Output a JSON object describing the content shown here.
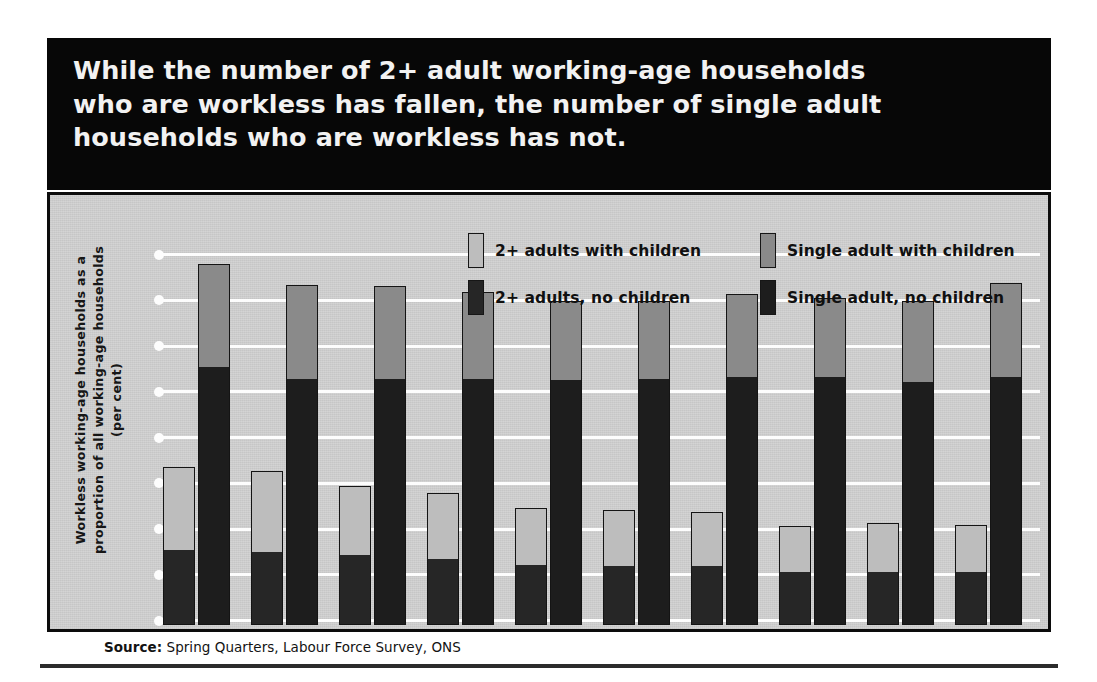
{
  "banner": {
    "title": "While the number of 2+ adult working-age households\nwho are workless has fallen, the number of single adult\nhouseholds who are workless has not."
  },
  "axis": {
    "y_title_line1": "Workless working-age households as a",
    "y_title_line2": "proportion of all working-age households",
    "y_title_line3": "(per cent)"
  },
  "legend": {
    "items": [
      {
        "label": "2+ adults with children",
        "swatch": "pair-light",
        "color": "#bdbdbd"
      },
      {
        "label": "2+ adults, no children",
        "swatch": "pair-dark",
        "color": "#262626"
      },
      {
        "label": "Single adult with children",
        "swatch": "single-light",
        "color": "#8a8a8a"
      },
      {
        "label": "Single adult, no children",
        "swatch": "single-dark",
        "color": "#1d1d1d"
      }
    ]
  },
  "source": {
    "prefix": "Source:",
    "text": " Spring Quarters, Labour Force Survey, ONS"
  },
  "chart_data": {
    "type": "bar",
    "subtype": "grouped-stacked",
    "title": "While the number of 2+ adult working-age households who are workless has fallen, the number of single adult households who are workless has not.",
    "xlabel": "",
    "ylabel": "Workless working-age households as a proportion of all working-age households (per cent)",
    "ylim": [
      0,
      9
    ],
    "yticks": [
      0,
      1,
      2,
      3,
      4,
      5,
      6,
      7,
      8,
      9
    ],
    "grid": true,
    "grid_axis": "y",
    "legend_position": "top-inside",
    "categories": [
      "1996",
      "1997",
      "1998",
      "1999",
      "2000",
      "2001",
      "2002",
      "2003",
      "2004",
      "2005"
    ],
    "groups": [
      {
        "name": "2+ adults",
        "series": [
          {
            "name": "2+ adults, no children",
            "color": "#262626",
            "values": [
              4.1,
              4.0,
              3.8,
              3.6,
              3.3,
              3.2,
              3.2,
              2.9,
              2.9,
              2.9
            ]
          },
          {
            "name": "2+ adults with children",
            "color": "#bdbdbd",
            "values": [
              4.4,
              4.3,
              3.7,
              3.5,
              3.0,
              3.0,
              2.9,
              2.4,
              2.6,
              2.5
            ]
          }
        ],
        "totals": [
          8.5,
          8.3,
          7.5,
          7.1,
          6.3,
          6.2,
          6.1,
          5.3,
          5.5,
          5.4
        ]
      },
      {
        "name": "Single adult",
        "series": [
          {
            "name": "Single adult, no children",
            "color": "#1d1d1d",
            "values": [
              13.9,
              13.3,
              13.3,
              13.3,
              13.2,
              13.3,
              13.4,
              13.4,
              13.1,
              13.4
            ]
          },
          {
            "name": "Single adult with children",
            "color": "#8a8a8a",
            "values": [
              5.5,
              5.0,
              4.9,
              4.6,
              4.2,
              4.1,
              4.4,
              4.2,
              4.3,
              5.0
            ]
          }
        ],
        "totals": [
          19.4,
          18.3,
          18.2,
          17.9,
          17.4,
          17.4,
          17.8,
          17.6,
          17.4,
          18.4
        ]
      }
    ]
  }
}
